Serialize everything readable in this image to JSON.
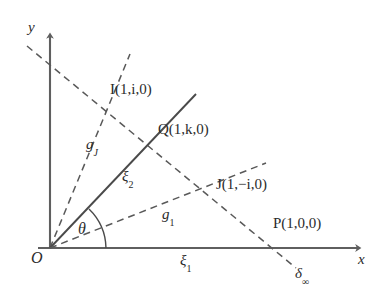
{
  "figure": {
    "background_color": "#ffffff",
    "line_color": "#555555",
    "text_color": "#2b2b2b",
    "width": 387,
    "height": 307
  },
  "axes": {
    "x_label": "x",
    "y_label": "y",
    "origin_label": "O",
    "x_axis_measure_label": "ξ",
    "x_axis_measure_sub": "1",
    "y_axis_style": "solid-arrow",
    "x_axis_style": "solid-arrow"
  },
  "points": [
    {
      "name": "I",
      "coords": "(1,i,0)",
      "label": "I(1,i,0)",
      "x": 105,
      "y": 97
    },
    {
      "name": "Q",
      "coords": "(1,k,0)",
      "label": "Q(1,k,0)",
      "x": 152,
      "y": 133
    },
    {
      "name": "J",
      "coords": "(1,−i,0)",
      "label": "J(1,−i,0)",
      "x": 212,
      "y": 185
    },
    {
      "name": "P",
      "coords": "(1,0,0)",
      "label": "P(1,0,0)",
      "x": 275,
      "y": 248
    }
  ],
  "lines": [
    {
      "name": "g_J",
      "label": "g",
      "sub": "J",
      "style": "dashed",
      "description": "ray from origin through I"
    },
    {
      "name": "xi_2",
      "label": "ξ",
      "sub": "2",
      "style": "solid",
      "description": "ray from origin through Q"
    },
    {
      "name": "g_1",
      "label": "g",
      "sub": "1",
      "style": "dashed",
      "description": "ray from origin through J"
    },
    {
      "name": "delta_infinity",
      "label": "δ",
      "sub": "∞",
      "style": "dashed",
      "description": "line at infinity crossing I, Q, J, P"
    },
    {
      "name": "xi_1",
      "label": "ξ",
      "sub": "1",
      "style": "solid",
      "description": "x axis"
    }
  ],
  "angle": {
    "label": "θ",
    "description": "angle between x axis and xi_2 line at origin"
  }
}
